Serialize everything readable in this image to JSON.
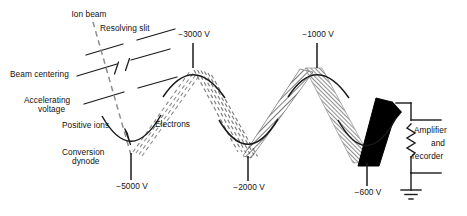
{
  "figure": {
    "type": "schematic-diagram",
    "colors": {
      "line": "#1a1a1a",
      "beam_dashed": "#8d8d8d",
      "beam_hatch": "#6f6f6f",
      "beam_gray": "#9a9a9a",
      "beam_solid": "#000000",
      "background": "#ffffff"
    }
  },
  "labels": {
    "ion_beam": "Ion beam",
    "resolving_slit": "Resolving slit",
    "beam_centering": "Beam centering",
    "accelerating_voltage_line1": "Accelerating",
    "accelerating_voltage_line2": "voltage",
    "positive_ions": "Positive ions",
    "electrons": "Electrons",
    "conversion_dynode_line1": "Conversion",
    "conversion_dynode_line2": "dynode",
    "amplifier_line1": "Amplifier",
    "amplifier_line2": "and",
    "amplifier_line3": "recorder"
  },
  "voltages": {
    "conversion_dynode": "−5000 V",
    "dynode_1": "−3000 V",
    "dynode_2": "−2000 V",
    "dynode_3": "−1000 V",
    "dynode_4": "−600 V"
  },
  "stages": [
    {
      "name": "conversion-dynode",
      "potential": "−5000 V",
      "position": "bottom",
      "x": 131,
      "y": 155
    },
    {
      "name": "dynode-1",
      "potential": "−3000 V",
      "position": "top",
      "x": 193,
      "y": 68
    },
    {
      "name": "dynode-2",
      "potential": "−2000 V",
      "position": "bottom",
      "x": 248,
      "y": 156
    },
    {
      "name": "dynode-3",
      "potential": "−1000 V",
      "position": "top",
      "x": 317,
      "y": 68
    },
    {
      "name": "dynode-4",
      "potential": "−600 V",
      "position": "bottom",
      "x": 366,
      "y": 162
    }
  ],
  "beams": [
    {
      "name": "ion-beam",
      "style": "dashed-single",
      "from": "entrance",
      "to": "conversion-dynode"
    },
    {
      "name": "electron-beam-1",
      "style": "dashed-narrow",
      "from": "conversion-dynode",
      "to": "dynode-1"
    },
    {
      "name": "electron-beam-2",
      "style": "dashed-wide",
      "from": "dynode-1",
      "to": "dynode-2"
    },
    {
      "name": "electron-beam-3",
      "style": "hatched",
      "from": "dynode-2",
      "to": "dynode-3"
    },
    {
      "name": "electron-beam-4",
      "style": "gray-solid",
      "from": "dynode-3",
      "to": "dynode-4"
    },
    {
      "name": "electron-beam-5",
      "style": "black-solid",
      "from": "dynode-4",
      "to": "anode"
    }
  ],
  "circuit": {
    "resistor": "zigzag-resistor",
    "ground": "earth-ground-symbol",
    "output_label": "Amplifier and recorder"
  },
  "optics": [
    {
      "name": "resolving-slit-plates",
      "label": "Resolving slit"
    },
    {
      "name": "beam-centering-plates",
      "label": "Beam centering"
    },
    {
      "name": "accelerating-plates",
      "label": "Accelerating voltage"
    }
  ]
}
